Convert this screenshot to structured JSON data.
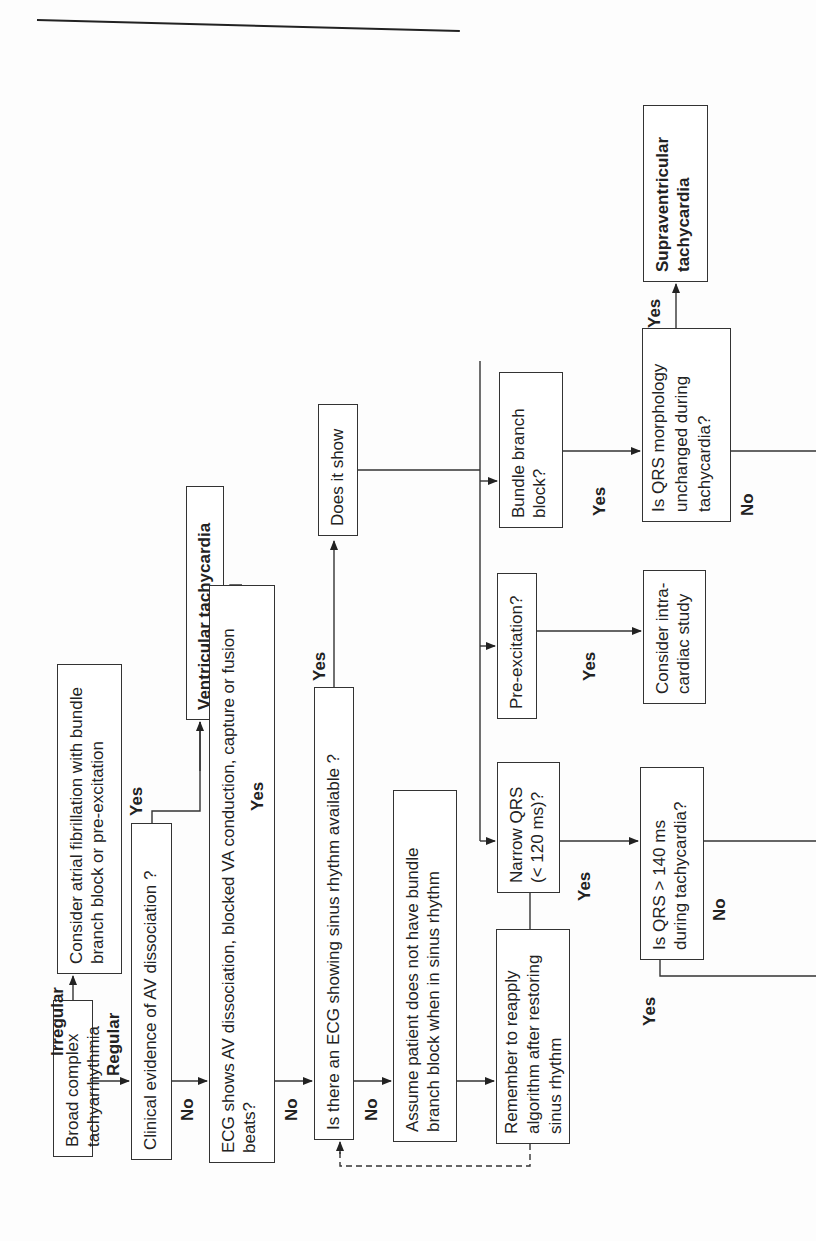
{
  "nodes": {
    "start": "Broad complex tachyarrhythmia",
    "consider_af": "Consider atrial fibrillation with bundle branch block or pre-excitation",
    "clinical_av": "Clinical evidence of AV dissociation ?",
    "vt": "Ventricular tachycardia",
    "ecg_av": "ECG shows AV dissociation, blocked VA conduction, capture or fusion beats?",
    "ecg_sinus": "Is there an ECG showing sinus rhythm available ?",
    "does_it_show": "Does it show",
    "assume_patient": "Assume patient does not have bundle branch block when in sinus rhythm",
    "remember": "Remember to reapply algorithm after restoring sinus rhythm",
    "narrow_qrs": "Narrow QRS (< 120 ms)?",
    "pre_excitation": "Pre-excitation?",
    "bundle_branch": "Bundle branch block?",
    "consider_intra": "Consider intra-cardiac study",
    "qrs_140": "Is QRS > 140 ms during tachycardia?",
    "qrs_morph": "Is QRS morphology unchanged during tachycardia?",
    "svt": "Supraventricular tachycardia"
  },
  "labels": {
    "irregular": "Irregular",
    "regular": "Regular",
    "yes": "Yes",
    "no": "No"
  }
}
